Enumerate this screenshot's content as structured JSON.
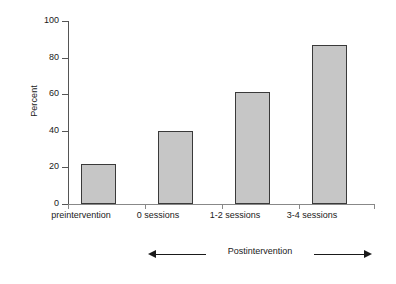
{
  "chart_data": {
    "type": "bar",
    "title": "",
    "xlabel": "",
    "ylabel": "Percent",
    "categories": [
      "preintervention",
      "0 sessions",
      "1-2 sessions",
      "3-4 sessions"
    ],
    "values": [
      22,
      40,
      61,
      87
    ],
    "ylim": [
      0,
      100
    ],
    "yticks": [
      0,
      20,
      40,
      60,
      80,
      100
    ],
    "ytick_labels": [
      "0",
      "20",
      "40",
      "60",
      "80",
      "100"
    ],
    "grid": false,
    "legend": null,
    "annotations": [
      {
        "text": "Postintervention",
        "style": "double-headed-arrow",
        "spans_categories": [
          "0 sessions",
          "1-2 sessions",
          "3-4 sessions"
        ]
      }
    ],
    "colors": {
      "bar_fill": "#c6c6c6",
      "bar_border": "#3a3a3a",
      "axis": "#555555",
      "text": "#1a1a1a",
      "background": "#ffffff"
    }
  }
}
